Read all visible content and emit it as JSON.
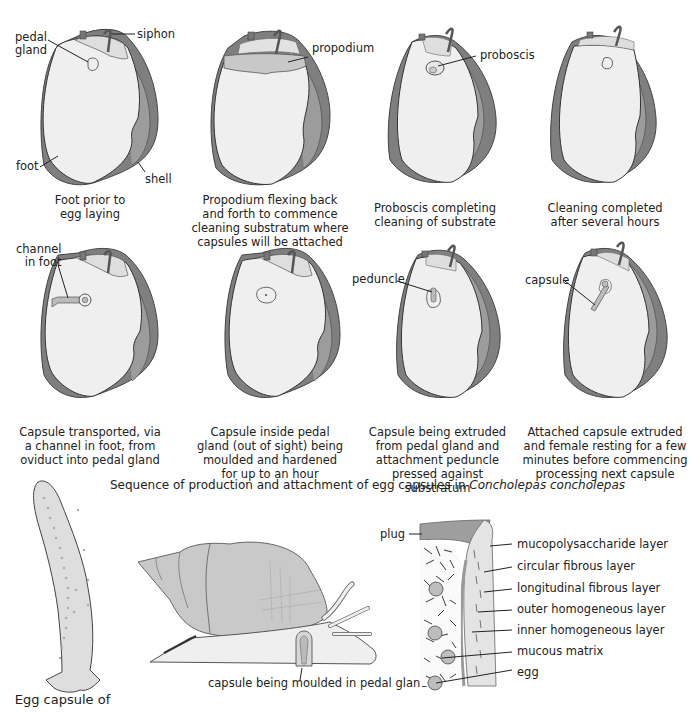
{
  "figure": {
    "title_plain": "Sequence of production and attachment of egg capsules in ",
    "title_italic": "Concholepas concholepas"
  },
  "panels": [
    {
      "id": 1,
      "labels": {
        "pedal_gland": "pedal\ngland",
        "siphon": "siphon",
        "foot": "foot",
        "shell": "shell"
      },
      "caption": [
        "Foot prior to",
        "egg laying"
      ]
    },
    {
      "id": 2,
      "labels": {
        "propodium": "propodium"
      },
      "caption": [
        "Propodium flexing back",
        "and forth to commence",
        "cleaning substratum where",
        "capsules will be attached"
      ]
    },
    {
      "id": 3,
      "labels": {
        "proboscis": "proboscis"
      },
      "caption": [
        "Proboscis completing",
        "cleaning of substrate"
      ]
    },
    {
      "id": 4,
      "labels": {},
      "caption": [
        "Cleaning completed",
        "after several hours"
      ]
    },
    {
      "id": 5,
      "labels": {
        "channel_in_foot": "channel\nin foot"
      },
      "caption": [
        "Capsule transported, via",
        "a channel in foot, from",
        "oviduct into pedal gland"
      ]
    },
    {
      "id": 6,
      "labels": {},
      "caption": [
        "Capsule inside pedal",
        "gland (out of sight) being",
        "moulded and hardened",
        "for up to an hour"
      ]
    },
    {
      "id": 7,
      "labels": {
        "peduncle": "peduncle"
      },
      "caption": [
        "Capsule being extruded",
        "from pedal gland and",
        "attachment peduncle",
        "pressed against substratum"
      ]
    },
    {
      "id": 8,
      "labels": {
        "capsule": "capsule"
      },
      "caption": [
        "Attached capsule extruded",
        "and female resting for a few",
        "minutes before commencing",
        "processing next capsule"
      ]
    }
  ],
  "lower": {
    "egg_capsule_caption": "Egg capsule of",
    "snail_label": "capsule being moulded in pedal gland",
    "wall": {
      "plug": "plug",
      "layers": [
        "mucopolysaccharide layer",
        "circular fibrous layer",
        "longitudinal fibrous layer",
        "outer homogeneous layer",
        "inner homogeneous layer",
        "mucous matrix",
        "egg"
      ]
    }
  },
  "colors": {
    "foot_fill": "#efefef",
    "foot_stroke": "#333333",
    "shell_dark": "#7a7a7a",
    "shell_mid": "#9a9a9a",
    "propodium": "#c8c8c8",
    "plug": "#9e9e9e",
    "snail_shell": "#c9c9c9"
  }
}
